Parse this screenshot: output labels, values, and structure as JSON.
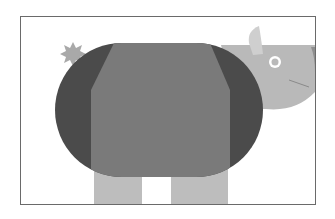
{
  "illustration": {
    "subject": "rhinoceros",
    "style": "flat geometric grayscale",
    "colors": {
      "background": "#ffffff",
      "frame_border": "#6a6a6a",
      "body_outer": "#4b4b4b",
      "body_center": "#7a7a7a",
      "head": "#b9b9b9",
      "horn": "#cfcfcf",
      "legs": "#bdbdbd",
      "tail_tuft": "#a9a9a9",
      "eye_ring": "#ffffff",
      "eye_center": "#b9b9b9",
      "mouth_line": "#8a8a8a"
    }
  }
}
